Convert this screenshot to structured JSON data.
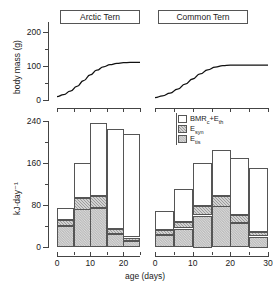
{
  "panels": {
    "left_title": "Arctic Tern",
    "right_title": "Common Tern"
  },
  "axes": {
    "top_ylabel": "body mass (g)",
    "top_yticks": [
      "0",
      "100",
      "200"
    ],
    "top_yminor": [
      "50",
      "150"
    ],
    "bottom_ylabel": "kJ·day⁻¹",
    "bottom_yticks": [
      "0",
      "80",
      "160",
      "240"
    ],
    "bottom_yminor": [
      "40",
      "120",
      "200"
    ],
    "xlabel": "age (days)",
    "left_xticks": [
      "0",
      "10",
      "20"
    ],
    "left_xminor": [
      "5",
      "15",
      "25"
    ],
    "right_xticks": [
      "0",
      "10",
      "20",
      "30"
    ],
    "right_xminor": [
      "5",
      "15",
      "25"
    ]
  },
  "legend": {
    "items": [
      {
        "label": "BMR",
        "sub": "c",
        "suffix": "+E",
        "sub2": "th",
        "swatch": "open-white",
        "name": "bmr-eth"
      },
      {
        "label": "E",
        "sub": "syn",
        "suffix": "",
        "sub2": "",
        "swatch": "dark-checker",
        "name": "esyn"
      },
      {
        "label": "E",
        "sub": "tis",
        "suffix": "",
        "sub2": "",
        "swatch": "light-stipple",
        "name": "etis"
      }
    ],
    "text": [
      "BMRᶜ+Eₜₕ",
      "Eₛᶏₙ",
      "Eₜᵢₛ"
    ]
  },
  "colors": {
    "ink": "#1a1a1a",
    "axis": "#444444",
    "seg_top": "#ffffff",
    "seg_mid": "#9c9c9c",
    "seg_bot": "#e2e2e2"
  },
  "chart_data": [
    {
      "type": "line",
      "name": "arctic-tern-growth",
      "title": "Arctic Tern",
      "xlabel": "age (days)",
      "ylabel": "body mass (g)",
      "xlim": [
        0,
        25
      ],
      "ylim": [
        0,
        230
      ],
      "grid": false,
      "legend": "none",
      "x": [
        0,
        2,
        4,
        6,
        8,
        10,
        12,
        14,
        16,
        18,
        20,
        22,
        24,
        25
      ],
      "y": [
        10,
        16,
        26,
        40,
        57,
        74,
        88,
        98,
        104,
        108,
        110,
        111,
        111,
        111
      ]
    },
    {
      "type": "line",
      "name": "common-tern-growth",
      "title": "Common Tern",
      "xlabel": "age (days)",
      "ylabel": "body mass (g)",
      "xlim": [
        0,
        30
      ],
      "ylim": [
        0,
        230
      ],
      "grid": false,
      "legend": "none",
      "x": [
        0,
        2,
        4,
        6,
        8,
        10,
        12,
        14,
        16,
        18,
        20,
        22,
        24,
        26,
        28,
        30
      ],
      "y": [
        7,
        12,
        20,
        32,
        47,
        62,
        77,
        89,
        97,
        101,
        103,
        103,
        103,
        103,
        103,
        103
      ]
    },
    {
      "type": "bar",
      "name": "arctic-tern-energy-budget",
      "stacked": true,
      "title": "Arctic Tern",
      "xlabel": "age (days)",
      "ylabel": "kJ·day⁻¹",
      "xlim": [
        0,
        25
      ],
      "ylim": [
        0,
        250
      ],
      "grid": false,
      "legend": "upper-right",
      "categories": [
        "0-5",
        "5-10",
        "10-15",
        "15-20",
        "20-25"
      ],
      "bin_edges": [
        0,
        5,
        10,
        15,
        20,
        25
      ],
      "series": [
        {
          "name": "E_tis",
          "values": [
            40,
            72,
            75,
            25,
            12
          ]
        },
        {
          "name": "E_syn",
          "values": [
            12,
            22,
            23,
            10,
            6
          ]
        },
        {
          "name": "BMR_c+E_th",
          "values": [
            23,
            66,
            139,
            190,
            197
          ]
        }
      ],
      "totals": [
        75,
        160,
        237,
        225,
        215
      ]
    },
    {
      "type": "bar",
      "name": "common-tern-energy-budget",
      "stacked": true,
      "title": "Common Tern",
      "xlabel": "age (days)",
      "ylabel": "kJ·day⁻¹",
      "xlim": [
        0,
        30
      ],
      "ylim": [
        0,
        250
      ],
      "grid": false,
      "legend": "upper-right",
      "categories": [
        "0-5",
        "5-10",
        "10-15",
        "15-20",
        "20-25",
        "25-30"
      ],
      "bin_edges": [
        0,
        5,
        10,
        15,
        20,
        25,
        30
      ],
      "series": [
        {
          "name": "E_tis",
          "values": [
            22,
            35,
            60,
            78,
            45,
            20
          ]
        },
        {
          "name": "E_syn",
          "values": [
            10,
            12,
            18,
            20,
            16,
            8
          ]
        },
        {
          "name": "BMR_c+E_th",
          "values": [
            36,
            63,
            82,
            87,
            109,
            122
          ]
        }
      ],
      "totals": [
        68,
        110,
        160,
        185,
        170,
        150
      ]
    }
  ]
}
